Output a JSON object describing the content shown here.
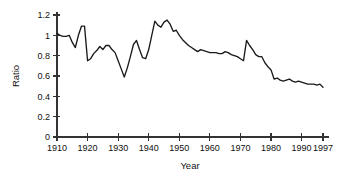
{
  "chart_data": {
    "type": "line",
    "title": "",
    "xlabel": "Year",
    "ylabel": "Ratio",
    "xlim": [
      1910,
      1997
    ],
    "ylim": [
      0,
      1.2
    ],
    "grid": false,
    "legend": null,
    "xticks": [
      1910,
      1920,
      1930,
      1940,
      1950,
      1960,
      1970,
      1980,
      1990,
      1997
    ],
    "xtick_labels": [
      "1910",
      "1920",
      "1930",
      "1940",
      "1950",
      "1960",
      "1970",
      "1980",
      "1990",
      "1997"
    ],
    "yticks": [
      0,
      0.2,
      0.4,
      0.6,
      0.8,
      1,
      1.2
    ],
    "ytick_labels": [
      "0",
      "0.2",
      "0.4",
      "0.6",
      "0.8",
      "1",
      "1.2"
    ],
    "series": [
      {
        "name": "Ratio",
        "color": "#1a1a1a",
        "x": [
          1910,
          1911,
          1912,
          1913,
          1914,
          1915,
          1916,
          1917,
          1918,
          1919,
          1920,
          1921,
          1922,
          1923,
          1924,
          1925,
          1926,
          1927,
          1928,
          1929,
          1930,
          1931,
          1932,
          1933,
          1934,
          1935,
          1936,
          1937,
          1938,
          1939,
          1940,
          1941,
          1942,
          1943,
          1944,
          1945,
          1946,
          1947,
          1948,
          1949,
          1950,
          1951,
          1952,
          1953,
          1954,
          1955,
          1956,
          1957,
          1958,
          1959,
          1960,
          1961,
          1962,
          1963,
          1964,
          1965,
          1966,
          1967,
          1968,
          1969,
          1970,
          1971,
          1972,
          1973,
          1974,
          1975,
          1976,
          1977,
          1978,
          1979,
          1980,
          1981,
          1982,
          1983,
          1984,
          1985,
          1986,
          1987,
          1988,
          1989,
          1990,
          1991,
          1992,
          1993,
          1994,
          1995,
          1996,
          1997
        ],
        "values": [
          1.02,
          1.0,
          0.99,
          0.99,
          1.0,
          0.93,
          0.88,
          1.0,
          1.09,
          1.09,
          0.75,
          0.77,
          0.82,
          0.85,
          0.89,
          0.86,
          0.9,
          0.9,
          0.86,
          0.83,
          0.75,
          0.67,
          0.59,
          0.68,
          0.79,
          0.91,
          0.95,
          0.86,
          0.78,
          0.77,
          0.86,
          1.0,
          1.14,
          1.1,
          1.08,
          1.13,
          1.15,
          1.11,
          1.04,
          1.05,
          1.0,
          0.96,
          0.93,
          0.9,
          0.88,
          0.86,
          0.84,
          0.86,
          0.85,
          0.84,
          0.83,
          0.83,
          0.83,
          0.82,
          0.82,
          0.84,
          0.83,
          0.81,
          0.8,
          0.79,
          0.77,
          0.75,
          0.95,
          0.9,
          0.86,
          0.81,
          0.79,
          0.79,
          0.73,
          0.69,
          0.66,
          0.57,
          0.58,
          0.56,
          0.55,
          0.56,
          0.57,
          0.55,
          0.54,
          0.55,
          0.54,
          0.53,
          0.52,
          0.52,
          0.52,
          0.51,
          0.52,
          0.49
        ]
      }
    ]
  }
}
